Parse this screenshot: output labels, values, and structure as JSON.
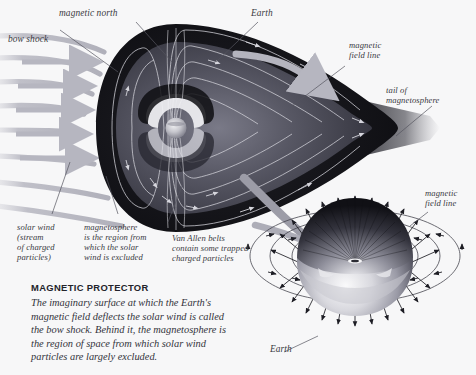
{
  "page": {
    "background_color": "#f7f7f8",
    "width": 476,
    "height": 375
  },
  "colors": {
    "ink": "#3a3a42",
    "caption_title": "#23232a",
    "caption_body": "#33333b",
    "magnetosphere_dark": "#121216",
    "magnetosphere_mid": "#4a4a55",
    "field_line": "#cfcfd6",
    "solar_wind": "#b9b9c2",
    "leader_line": "#6e6e7a"
  },
  "labels": {
    "magnetic_north": "magnetic north",
    "bow_shock": "bow shock",
    "earth_main": "Earth",
    "magnetic_field_line_top": "magnetic\nfield line",
    "tail_of_magnetosphere": "tail of\nmagnetosphere",
    "magnetic_field_line_inset": "magnetic\nfield line",
    "solar_wind": "solar wind\n(stream\nof charged\nparticles)",
    "magnetosphere": "magnetosphere\nis the region from\nwhich the solar\nwind is excluded",
    "van_allen_belts": "Van Allen belts\ncontain some trapped\ncharged particles",
    "earth_inset": "Earth"
  },
  "caption": {
    "title": "MAGNETIC PROTECTOR",
    "body": "The imaginary surface at which the Earth's magnetic field deflects the solar wind is called the bow shock. Behind it, the magnetosphere is the region of space from which solar wind particles are largely excluded."
  },
  "diagram": {
    "type": "scientific-illustration",
    "main_view": {
      "description": "Teardrop-shaped magnetosphere with Earth at center, compressed on the sunward (left) side by solar wind and drawn into a long tail on the right",
      "solar_wind_arrow_count": 7,
      "field_loop_count": 6
    },
    "inset_view": {
      "description": "Close-up globe of Earth with dipole magnetic field lines radiating outward and looping around",
      "radial_arrow_count": 34,
      "loop_count": 4
    }
  }
}
